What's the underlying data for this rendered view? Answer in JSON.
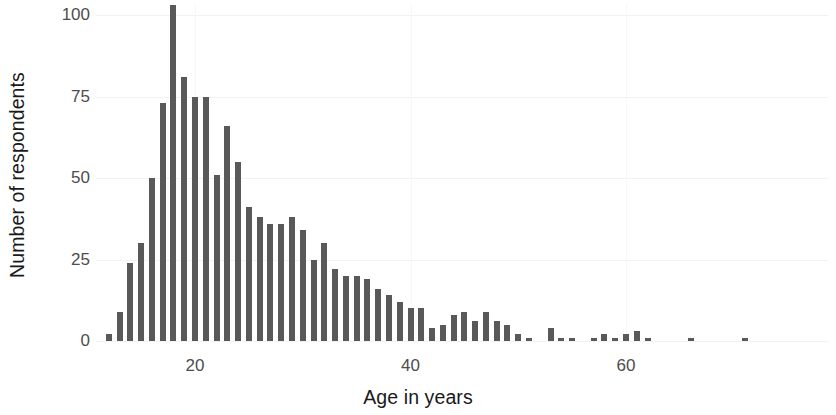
{
  "chart_data": {
    "type": "bar",
    "title": "",
    "subtitle": "",
    "xlabel": "Age in years",
    "ylabel": "Number of respondents",
    "xlim": [
      11,
      73
    ],
    "ylim": [
      0,
      105
    ],
    "x_ticks": [
      20,
      40,
      60
    ],
    "x_tick_labels": [
      "20",
      "40",
      "60"
    ],
    "y_ticks": [
      0,
      25,
      50,
      75,
      100
    ],
    "y_tick_labels": [
      "0",
      "25",
      "50",
      "75",
      "100"
    ],
    "grid": "faint horizontal gridlines at y ticks",
    "legend": null,
    "bar_color": "#595959",
    "background_color": "#ffffff",
    "categories": [
      12,
      13,
      14,
      15,
      16,
      17,
      18,
      19,
      20,
      21,
      22,
      23,
      24,
      25,
      26,
      27,
      28,
      29,
      30,
      31,
      32,
      33,
      34,
      35,
      36,
      37,
      38,
      39,
      40,
      41,
      42,
      43,
      44,
      45,
      46,
      47,
      48,
      49,
      50,
      51,
      53,
      54,
      55,
      57,
      58,
      59,
      60,
      61,
      62,
      66,
      71
    ],
    "values": [
      2,
      9,
      24,
      30,
      50,
      73,
      103,
      81,
      75,
      75,
      51,
      66,
      55,
      41,
      38,
      36,
      36,
      38,
      34,
      25,
      30,
      22,
      20,
      20,
      19,
      16,
      14,
      12,
      10,
      10,
      4,
      5,
      8,
      9,
      6,
      9,
      6,
      5,
      2,
      1,
      4,
      1,
      1,
      1,
      2,
      1,
      2,
      3,
      1,
      1,
      1
    ]
  },
  "axis": {
    "y_title": "Number of respondents",
    "x_title": "Age in years"
  }
}
